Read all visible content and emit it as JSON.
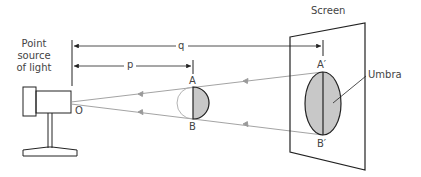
{
  "labels": {
    "source_line1": "Point",
    "source_line2": "source",
    "source_line3": "of light",
    "source_point": "O",
    "screen": "Screen",
    "distance_q": "q",
    "distance_p": "p",
    "object_top": "A",
    "object_bottom": "B",
    "image_top": "A′",
    "image_bottom": "B′",
    "umbra": "Umbra"
  },
  "colors": {
    "line": "#222222",
    "ray": "#999999",
    "shadow_fill": "#c8c8c8",
    "text": "#444444"
  }
}
